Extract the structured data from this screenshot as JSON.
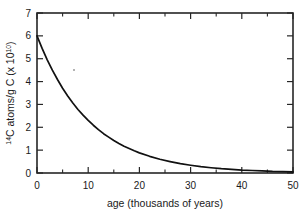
{
  "chart_data": {
    "type": "line",
    "title": "",
    "xlabel": "age (thousands of years)",
    "ylabel_parts": {
      "sup": "14",
      "main": "C atoms/g C (x 10",
      "exp": "10",
      "close": ")"
    },
    "ylabel": "14C atoms/g C (x 10^10)",
    "xlim": [
      0,
      50
    ],
    "ylim": [
      0,
      7
    ],
    "xticks": [
      0,
      10,
      20,
      30,
      40,
      50
    ],
    "xticklabels": [
      "0",
      "10",
      "20",
      "30",
      "40",
      "50"
    ],
    "xminorticks": [
      5,
      15,
      25,
      35,
      45
    ],
    "yticks": [
      0,
      1,
      2,
      3,
      4,
      5,
      6,
      7
    ],
    "yticklabels": [
      "0",
      "1",
      "2",
      "3",
      "4",
      "5",
      "6",
      "7"
    ],
    "grid": false,
    "legend": false,
    "series": [
      {
        "name": "14C decay",
        "color": "#111111",
        "x": [
          0,
          1,
          2,
          3,
          4,
          5,
          6,
          7,
          8,
          9,
          10,
          11,
          12,
          13,
          14,
          15,
          16,
          17,
          18,
          19,
          20,
          22,
          24,
          26,
          28,
          30,
          32,
          34,
          36,
          38,
          40,
          42,
          44,
          46,
          48,
          50
        ],
        "values": [
          6.0,
          5.45,
          4.95,
          4.5,
          4.09,
          3.71,
          3.37,
          3.06,
          2.78,
          2.53,
          2.3,
          2.09,
          1.9,
          1.72,
          1.57,
          1.42,
          1.29,
          1.17,
          1.07,
          0.97,
          0.88,
          0.73,
          0.6,
          0.5,
          0.41,
          0.34,
          0.28,
          0.23,
          0.19,
          0.16,
          0.13,
          0.11,
          0.09,
          0.07,
          0.06,
          0.05
        ]
      }
    ],
    "annotations": []
  }
}
